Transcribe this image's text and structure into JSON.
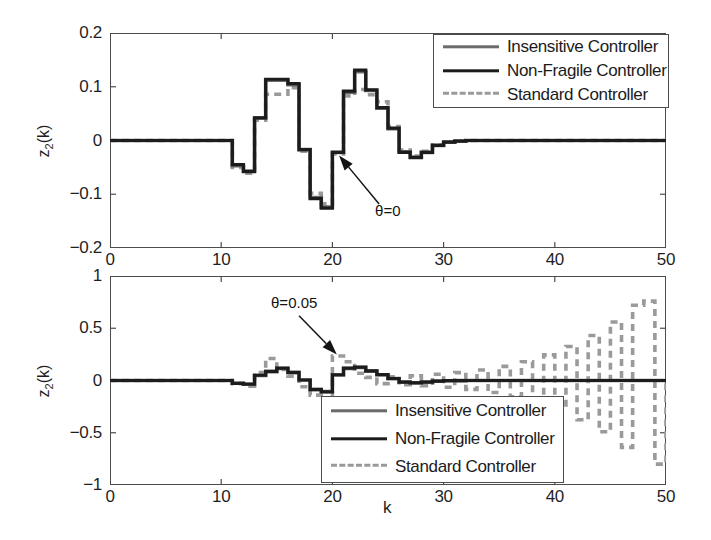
{
  "figure": {
    "xlabel": "k",
    "width": 711,
    "height": 540,
    "background": "#ffffff"
  },
  "colors": {
    "insensitive": "#6b6b6b",
    "non_fragile": "#1c1c1c",
    "standard": "#9a9a9a",
    "axis": "#4c4c4c",
    "text": "#1a1a1a"
  },
  "legend": {
    "entries": [
      {
        "label": "Insensitive Controller",
        "style": "solid",
        "color": "#6b6b6b",
        "thickness": 3.4
      },
      {
        "label": "Non-Fragile Controller",
        "style": "solid",
        "color": "#1c1c1c",
        "thickness": 3.4
      },
      {
        "label": "Standard Controller",
        "style": "dashed",
        "color": "#9a9a9a",
        "thickness": 3.4
      }
    ],
    "position_top": "northeast",
    "position_bottom": "southeast"
  },
  "chart_data": [
    {
      "id": "panel-top",
      "type": "line",
      "drawstyle": "steps-post",
      "title": "",
      "xlabel": "",
      "ylabel": "z_2(k)",
      "ylabel_text": "z2(k)",
      "xlim": [
        0,
        50
      ],
      "ylim": [
        -0.2,
        0.2
      ],
      "xticks": [
        0,
        10,
        20,
        30,
        40,
        50
      ],
      "xticklabels": [
        "0",
        "10",
        "20",
        "30",
        "40",
        "50"
      ],
      "yticks": [
        -0.2,
        -0.1,
        0,
        0.1,
        0.2
      ],
      "yticklabels": [
        "-0.2",
        "-0.1",
        "0",
        "0.1",
        "0.2"
      ],
      "grid": false,
      "annotations": [
        {
          "text": "θ=0",
          "text_x": 24.2,
          "text_y": -0.118,
          "arrow_tip_x": 20.6,
          "arrow_tip_y": -0.028
        }
      ],
      "x": [
        0,
        1,
        2,
        3,
        4,
        5,
        6,
        7,
        8,
        9,
        10,
        11,
        12,
        13,
        14,
        15,
        16,
        17,
        18,
        19,
        20,
        21,
        22,
        23,
        24,
        25,
        26,
        27,
        28,
        29,
        30,
        31,
        32,
        33,
        34,
        35,
        36,
        37,
        38,
        39,
        40,
        41,
        42,
        43,
        44,
        45,
        46,
        47,
        48,
        49,
        50
      ],
      "series": [
        {
          "name": "Insensitive Controller",
          "style": "solid",
          "color": "#6b6b6b",
          "values": [
            0,
            0,
            0,
            0,
            0,
            0,
            0,
            0,
            0,
            0,
            0,
            -0.047,
            -0.057,
            0.042,
            0.112,
            0.112,
            0.104,
            -0.017,
            -0.106,
            -0.124,
            -0.022,
            0.09,
            0.128,
            0.093,
            0.06,
            0.022,
            -0.021,
            -0.031,
            -0.022,
            -0.009,
            -0.003,
            -0.001,
            0,
            0,
            0,
            0,
            0,
            0,
            0,
            0,
            0,
            0,
            0,
            0,
            0,
            0,
            0,
            0,
            0,
            0,
            0
          ]
        },
        {
          "name": "Non-Fragile Controller",
          "style": "solid",
          "color": "#1c1c1c",
          "values": [
            0,
            0,
            0,
            0,
            0,
            0,
            0,
            0,
            0,
            0,
            0,
            -0.045,
            -0.058,
            0.042,
            0.114,
            0.114,
            0.106,
            -0.017,
            -0.108,
            -0.126,
            -0.022,
            0.092,
            0.131,
            0.094,
            0.061,
            0.023,
            -0.022,
            -0.032,
            -0.022,
            -0.009,
            -0.003,
            -0.001,
            0,
            0,
            0,
            0,
            0,
            0,
            0,
            0,
            0,
            0,
            0,
            0,
            0,
            0,
            0,
            0,
            0,
            0,
            0
          ]
        },
        {
          "name": "Standard Controller",
          "style": "dashed",
          "color": "#9a9a9a",
          "values": [
            0,
            0,
            0,
            0,
            0,
            0,
            0,
            0,
            0,
            0,
            0,
            -0.05,
            -0.061,
            0.038,
            0.086,
            0.086,
            0.098,
            -0.02,
            -0.098,
            -0.118,
            -0.025,
            0.083,
            0.095,
            0.085,
            0.072,
            0.026,
            -0.018,
            -0.029,
            -0.02,
            -0.008,
            -0.003,
            -0.001,
            0,
            0,
            0,
            0,
            0,
            0,
            0,
            0,
            0,
            0,
            0,
            0,
            0,
            0,
            0,
            0,
            0,
            0,
            0
          ]
        }
      ]
    },
    {
      "id": "panel-bottom",
      "type": "line",
      "drawstyle": "steps-post",
      "title": "",
      "xlabel": "k",
      "ylabel": "z_2(k)",
      "ylabel_text": "z2(k)",
      "xlim": [
        0,
        50
      ],
      "ylim": [
        -1,
        1
      ],
      "xticks": [
        0,
        10,
        20,
        30,
        40,
        50
      ],
      "xticklabels": [
        "0",
        "10",
        "20",
        "30",
        "40",
        "50"
      ],
      "yticks": [
        -1,
        -0.5,
        0,
        0.5,
        1
      ],
      "yticklabels": [
        "-1",
        "-0.5",
        "0",
        "0.5",
        "1"
      ],
      "grid": false,
      "annotations": [
        {
          "text": "θ=0.05",
          "text_x": 17.0,
          "text_y": 0.62,
          "arrow_tip_x": 20.4,
          "arrow_tip_y": 0.25
        }
      ],
      "x": [
        0,
        1,
        2,
        3,
        4,
        5,
        6,
        7,
        8,
        9,
        10,
        11,
        12,
        13,
        14,
        15,
        16,
        17,
        18,
        19,
        20,
        21,
        22,
        23,
        24,
        25,
        26,
        27,
        28,
        29,
        30,
        31,
        32,
        33,
        34,
        35,
        36,
        37,
        38,
        39,
        40,
        41,
        42,
        43,
        44,
        45,
        46,
        47,
        48,
        49,
        50
      ],
      "series": [
        {
          "name": "Insensitive Controller",
          "style": "solid",
          "color": "#6b6b6b",
          "values": [
            0,
            0,
            0,
            0,
            0,
            0,
            0,
            0,
            0,
            0,
            0,
            -0.026,
            -0.034,
            0.048,
            0.085,
            0.115,
            0.075,
            0.005,
            -0.085,
            -0.105,
            0.052,
            0.115,
            0.125,
            0.09,
            0.055,
            0.018,
            -0.015,
            -0.022,
            -0.015,
            -0.006,
            -0.002,
            -0.001,
            0,
            0,
            0,
            0,
            0,
            0,
            0,
            0,
            0,
            0,
            0,
            0,
            0,
            0,
            0,
            0,
            0,
            0,
            0
          ]
        },
        {
          "name": "Non-Fragile Controller",
          "style": "solid",
          "color": "#1c1c1c",
          "values": [
            0,
            0,
            0,
            0,
            0,
            0,
            0,
            0,
            0,
            0,
            0,
            -0.028,
            -0.036,
            0.05,
            0.088,
            0.118,
            0.078,
            0.005,
            -0.088,
            -0.108,
            0.055,
            0.118,
            0.128,
            0.092,
            0.056,
            0.019,
            -0.016,
            -0.023,
            -0.016,
            -0.006,
            -0.002,
            -0.001,
            0,
            0,
            0,
            0,
            0,
            0,
            0,
            0,
            0,
            0,
            0,
            0,
            0,
            0,
            0,
            0,
            0,
            0,
            0
          ]
        },
        {
          "name": "Standard Controller",
          "style": "dashed",
          "color": "#9a9a9a",
          "values": [
            0,
            0,
            0,
            0,
            0,
            0,
            0,
            0,
            0,
            0,
            0,
            -0.03,
            -0.055,
            0.075,
            0.21,
            0.105,
            0.04,
            -0.06,
            -0.14,
            -0.19,
            0.235,
            0.18,
            0.07,
            0.03,
            -0.03,
            0.035,
            -0.04,
            0.045,
            -0.05,
            0.06,
            -0.065,
            0.075,
            -0.085,
            0.1,
            -0.115,
            0.135,
            -0.155,
            0.18,
            -0.21,
            0.245,
            -0.28,
            0.325,
            -0.375,
            0.43,
            -0.49,
            0.56,
            -0.64,
            0.72,
            0.76,
            -0.8,
            0.0
          ]
        }
      ]
    }
  ]
}
